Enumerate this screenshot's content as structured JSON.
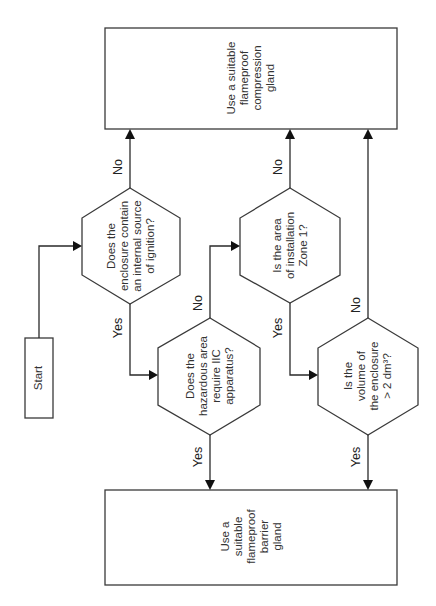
{
  "diagram": {
    "type": "flowchart",
    "orientation": "rotated -90deg",
    "start": {
      "label": "Start"
    },
    "decisions": [
      {
        "id": "q1",
        "lines": [
          "Does the",
          "enclosure contain",
          "an internal source",
          "of ignition?"
        ]
      },
      {
        "id": "q2",
        "lines": [
          "Does the",
          "hazardous area",
          "require IIC",
          "apparatus?"
        ]
      },
      {
        "id": "q3",
        "lines": [
          "Is the area",
          "of installation",
          "Zone 1?"
        ]
      },
      {
        "id": "q4",
        "lines": [
          "Is the",
          "volume of",
          "the enclosure",
          "> 2 dm³?"
        ]
      }
    ],
    "outcomes": [
      {
        "id": "compression",
        "lines": [
          "Use a suitable",
          "flameproof",
          "compression",
          "gland"
        ]
      },
      {
        "id": "barrier",
        "lines": [
          "Use a",
          "suitable",
          "flameproof",
          "barrier",
          "gland"
        ]
      }
    ],
    "edge_labels": {
      "q1_no": "No",
      "q1_yes": "Yes",
      "q2_no": "No",
      "q2_yes": "Yes",
      "q3_no": "No",
      "q3_yes": "Yes",
      "q4_no": "No",
      "q4_yes": "Yes"
    },
    "colors": {
      "stroke": "#3a3a3a",
      "text": "#333333",
      "background": "#ffffff"
    }
  }
}
